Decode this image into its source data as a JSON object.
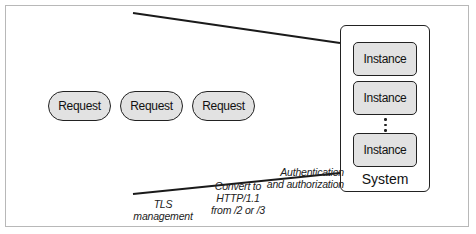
{
  "diagram": {
    "requests": [
      {
        "label": "Request"
      },
      {
        "label": "Request"
      },
      {
        "label": "Request"
      }
    ],
    "system": {
      "label": "System",
      "instances": [
        {
          "label": "Instance"
        },
        {
          "label": "Instance"
        },
        {
          "label": "Instance"
        }
      ],
      "ellipsis": "⋮"
    },
    "stages": [
      {
        "label_line1": "TLS",
        "label_line2": "management"
      },
      {
        "label_line1": "Convert to",
        "label_line2": "HTTP/1.1",
        "label_line3": "from /2 or /3"
      },
      {
        "label_line1": "Authentication",
        "label_line2": "and authorization"
      }
    ],
    "colors": {
      "box_fill": "#e2e2e2",
      "stroke": "#222222",
      "frame": "#b8b8b8"
    }
  }
}
